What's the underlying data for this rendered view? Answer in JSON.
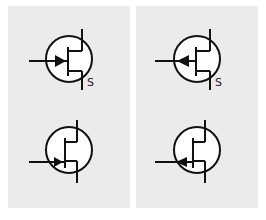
{
  "panels": [
    {
      "id": "left",
      "symbols": [
        {
          "type": "mosfet-enhancement-n-channel",
          "arrow": "inward",
          "label": "S"
        },
        {
          "type": "jfet-n-channel",
          "arrow": "inward",
          "label": ""
        }
      ]
    },
    {
      "id": "right",
      "symbols": [
        {
          "type": "mosfet-enhancement-p-channel",
          "arrow": "outward",
          "label": "S"
        },
        {
          "type": "jfet-p-channel",
          "arrow": "outward",
          "label": ""
        }
      ]
    }
  ],
  "colors": {
    "background": "#ebebeb",
    "stroke": "#111111",
    "circle_fill": "#ffffff"
  }
}
